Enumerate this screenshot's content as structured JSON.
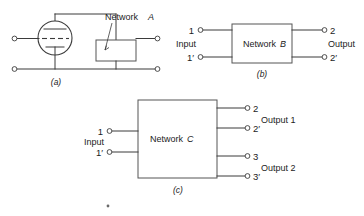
{
  "figure": {
    "panels": [
      {
        "caption": "(a)",
        "network_label_prefix": "Network",
        "network_label_letter": "A",
        "type": "vacuum-tube-with-network",
        "elements": {
          "tube": "triode-vacuum-tube",
          "plate": "plate-electrode",
          "grid": "grid-electrode-dashed",
          "cathode": "cathode-electrode",
          "network_box": "network-a-box",
          "left_terminal_top": "terminal-open-circle",
          "left_terminal_bottom": "terminal-open-circle",
          "right_terminal_top": "terminal-open-circle",
          "right_terminal_bottom": "terminal-open-circle"
        }
      },
      {
        "caption": "(b)",
        "network_label_prefix": "Network",
        "network_label_letter": "B",
        "type": "two-port-network",
        "input_label": "Input",
        "output_label": "Output",
        "terminals": {
          "input_top": "1",
          "input_bottom": "1′",
          "output_top": "2",
          "output_bottom": "2′"
        }
      },
      {
        "caption": "(c)",
        "network_label_prefix": "Network",
        "network_label_letter": "C",
        "type": "three-port-network",
        "input_label": "Input",
        "output_labels": [
          "Output 1",
          "Output 2"
        ],
        "terminals": {
          "input_top": "1",
          "input_bottom": "1′",
          "output1_top": "2",
          "output1_bottom": "2′",
          "output2_top": "3",
          "output2_bottom": "3′"
        }
      }
    ]
  },
  "colors": {
    "background": "#ffffff",
    "line": "#3b3b3b",
    "box_line": "#555555",
    "text": "#1c1c1c"
  }
}
